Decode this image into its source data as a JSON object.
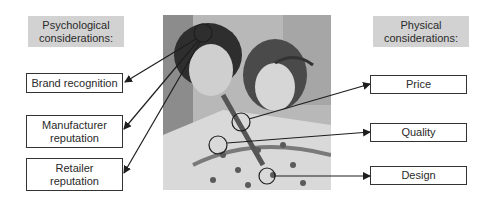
{
  "left": {
    "header": "Psychological considerations:",
    "items": [
      {
        "label": "Brand recognition"
      },
      {
        "label": "Manufacturer reputation"
      },
      {
        "label": "Retailer reputation"
      }
    ]
  },
  "right": {
    "header": "Physical considerations:",
    "items": [
      {
        "label": "Price"
      },
      {
        "label": "Quality"
      },
      {
        "label": "Design"
      }
    ]
  },
  "photo": {
    "description": "Two young women smiling and looking at a patterned garment"
  },
  "colors": {
    "header_bg": "#d2d2d2",
    "line": "#222222",
    "box_border": "#333333"
  }
}
